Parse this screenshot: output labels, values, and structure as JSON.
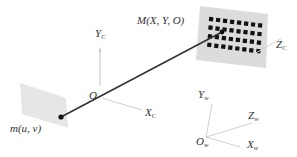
{
  "diagram": {
    "type": "camera-calibration-pinhole-model",
    "colors": {
      "board": "#dcdcdc",
      "image_plane": "#e6e6e6",
      "square": "#111111",
      "ray": "#333333",
      "axis": "#c8c8c8",
      "text": "#333333"
    },
    "calibration_board": {
      "label_main": "M(X,  Y,  O)",
      "rows": 4,
      "cols": 8
    },
    "image_plane": {
      "label_main": "m(u,  v)"
    },
    "camera_frame": {
      "origin_label": "O",
      "x_axis": {
        "main": "X",
        "sub": "C"
      },
      "y_axis": {
        "main": "Y",
        "sub": "C"
      },
      "z_axis": {
        "main": "Z",
        "sub": "C"
      }
    },
    "world_frame": {
      "origin": {
        "main": "O",
        "sub": "w"
      },
      "x_axis": {
        "main": "X",
        "sub": "w"
      },
      "y_axis": {
        "main": "Y",
        "sub": "w"
      },
      "z_axis": {
        "main": "Z",
        "sub": "w"
      }
    }
  }
}
